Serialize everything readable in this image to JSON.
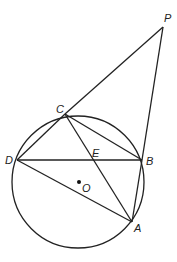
{
  "diagram": {
    "type": "geometry",
    "circle": {
      "center": "O",
      "cx": 78,
      "cy": 182,
      "r": 66
    },
    "points": {
      "P": {
        "label": "P",
        "x": 163,
        "y": 27,
        "lx": 164,
        "ly": 22
      },
      "C": {
        "label": "C",
        "x": 65,
        "y": 114,
        "lx": 56,
        "ly": 113
      },
      "D": {
        "label": "D",
        "x": 17,
        "y": 160,
        "lx": 5,
        "ly": 164
      },
      "E": {
        "label": "E",
        "x": 93,
        "y": 160,
        "lx": 92,
        "ly": 157
      },
      "B": {
        "label": "B",
        "x": 142,
        "y": 160,
        "lx": 146,
        "ly": 165
      },
      "A": {
        "label": "A",
        "x": 132,
        "y": 222,
        "lx": 134,
        "ly": 232
      },
      "O": {
        "label": "O",
        "x": 79,
        "y": 182,
        "lx": 82,
        "ly": 192
      }
    },
    "segments": [
      "PC",
      "PB",
      "CD",
      "CB",
      "CA",
      "DB",
      "DA",
      "BA"
    ]
  }
}
